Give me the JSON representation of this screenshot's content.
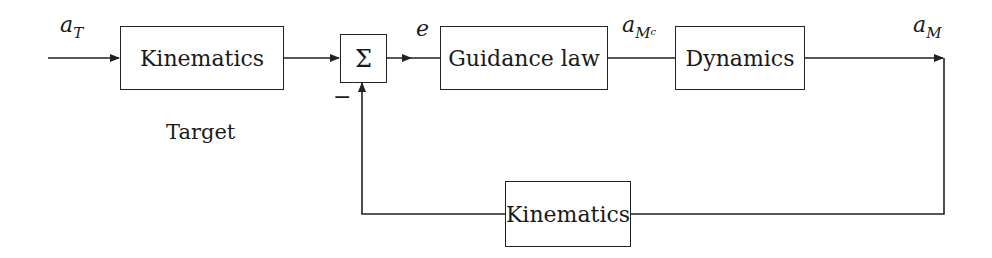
{
  "diagram": {
    "type": "block-diagram",
    "title": "",
    "blocks": {
      "target_kinematics": {
        "label": "Kinematics",
        "caption": "Target"
      },
      "summing_junction": {
        "label": "Σ",
        "negative_sign": "−"
      },
      "guidance_law": {
        "label": "Guidance law"
      },
      "dynamics": {
        "label": "Dynamics"
      },
      "feedback_kinematics": {
        "label": "Kinematics"
      }
    },
    "signals": {
      "input": {
        "base": "a",
        "subscript": "T"
      },
      "error": {
        "base": "e"
      },
      "command": {
        "base": "a",
        "subscript": "M",
        "subsubscript": "c"
      },
      "output": {
        "base": "a",
        "subscript": "M"
      }
    },
    "connections": [
      {
        "from": "input",
        "to": "target_kinematics"
      },
      {
        "from": "target_kinematics",
        "to": "summing_junction",
        "sign": "+"
      },
      {
        "from": "summing_junction",
        "to": "guidance_law",
        "signal": "error"
      },
      {
        "from": "guidance_law",
        "to": "dynamics",
        "signal": "command"
      },
      {
        "from": "dynamics",
        "to": "output",
        "signal": "output"
      },
      {
        "from": "output",
        "to": "feedback_kinematics"
      },
      {
        "from": "feedback_kinematics",
        "to": "summing_junction",
        "sign": "−"
      }
    ],
    "colors": {
      "line": "#222222",
      "background": "#ffffff"
    }
  }
}
